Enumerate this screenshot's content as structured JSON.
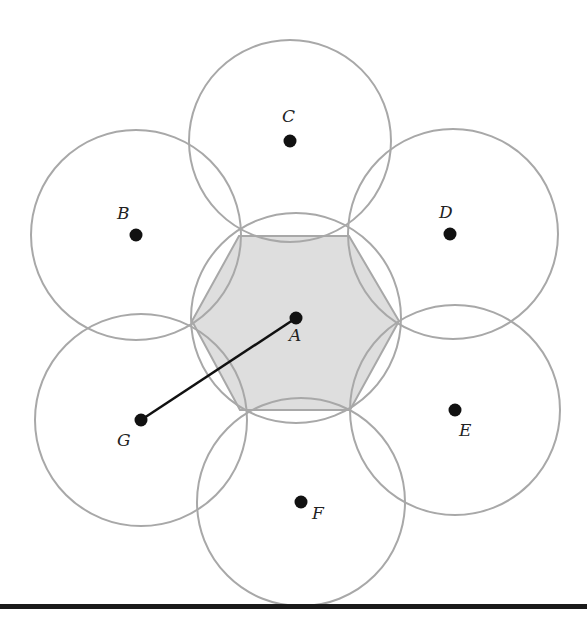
{
  "diagram": {
    "title": "",
    "colors": {
      "circle_stroke": "#a8a8a8",
      "hexagon_fill": "#dedede",
      "point": "#111111",
      "segment": "#111111",
      "rule": "#1a1a1a"
    },
    "points": [
      {
        "label": "A",
        "x": 296,
        "y": 318
      },
      {
        "label": "B",
        "x": 136,
        "y": 235
      },
      {
        "label": "C",
        "x": 290,
        "y": 141
      },
      {
        "label": "D",
        "x": 450,
        "y": 234
      },
      {
        "label": "E",
        "x": 455,
        "y": 410
      },
      {
        "label": "F",
        "x": 301,
        "y": 502
      },
      {
        "label": "G",
        "x": 141,
        "y": 420
      }
    ],
    "segment": {
      "from": "G",
      "to": "A"
    }
  }
}
